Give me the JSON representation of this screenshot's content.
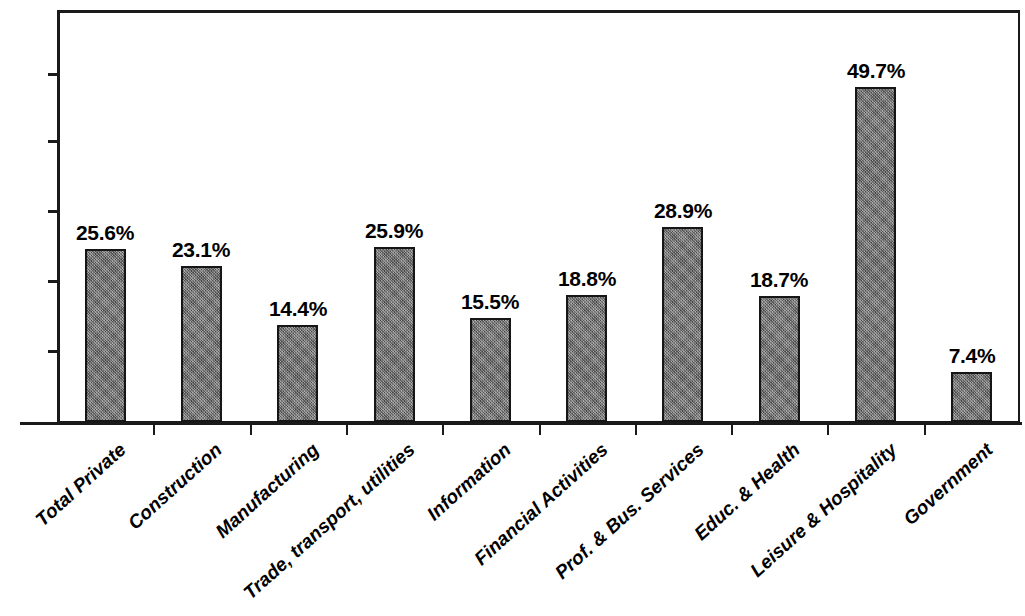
{
  "chart_data": {
    "type": "bar",
    "title": "",
    "subtitle": "",
    "xlabel": "",
    "ylabel": "",
    "ylim": [
      0,
      56
    ],
    "grid": false,
    "legend": null,
    "value_suffix": "%",
    "bar_color": "#6f6f6f",
    "bar_border_color": "#161616",
    "axis_color": "#1a1a1a",
    "y_axis_labeled": false,
    "y_tick_count": 5,
    "categories": [
      "Total Private",
      "Construction",
      "Manufacturing",
      "Trade, transport, utilities",
      "Information",
      "Financial Activities",
      "Prof. & Bus. Services",
      "Educ. & Health",
      "Leisure & Hospitality",
      "Government"
    ],
    "values": [
      25.6,
      23.1,
      14.4,
      25.9,
      15.5,
      18.8,
      28.9,
      18.7,
      49.7,
      7.4
    ],
    "data_labels": [
      "25.6%",
      "23.1%",
      "14.4%",
      "25.9%",
      "15.5%",
      "18.8%",
      "28.9%",
      "18.7%",
      "49.7%",
      "7.4%"
    ]
  }
}
